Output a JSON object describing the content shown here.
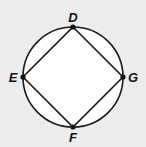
{
  "diagram": {
    "type": "inscribed-square-in-circle",
    "background": "#ececec",
    "circle": {
      "cx": 73,
      "cy": 77,
      "r": 50,
      "fill": "#ffffff",
      "stroke": "#1a1a1a"
    },
    "points": [
      {
        "name": "D",
        "x": 73,
        "y": 27,
        "label_x": 73,
        "label_y": 22
      },
      {
        "name": "E",
        "x": 23,
        "y": 77,
        "label_x": 12,
        "label_y": 81
      },
      {
        "name": "G",
        "x": 123,
        "y": 77,
        "label_x": 133,
        "label_y": 81
      },
      {
        "name": "F",
        "x": 73,
        "y": 127,
        "label_x": 73,
        "label_y": 142
      }
    ],
    "segments": [
      [
        "D",
        "G"
      ],
      [
        "G",
        "F"
      ],
      [
        "F",
        "E"
      ],
      [
        "E",
        "D"
      ]
    ]
  }
}
